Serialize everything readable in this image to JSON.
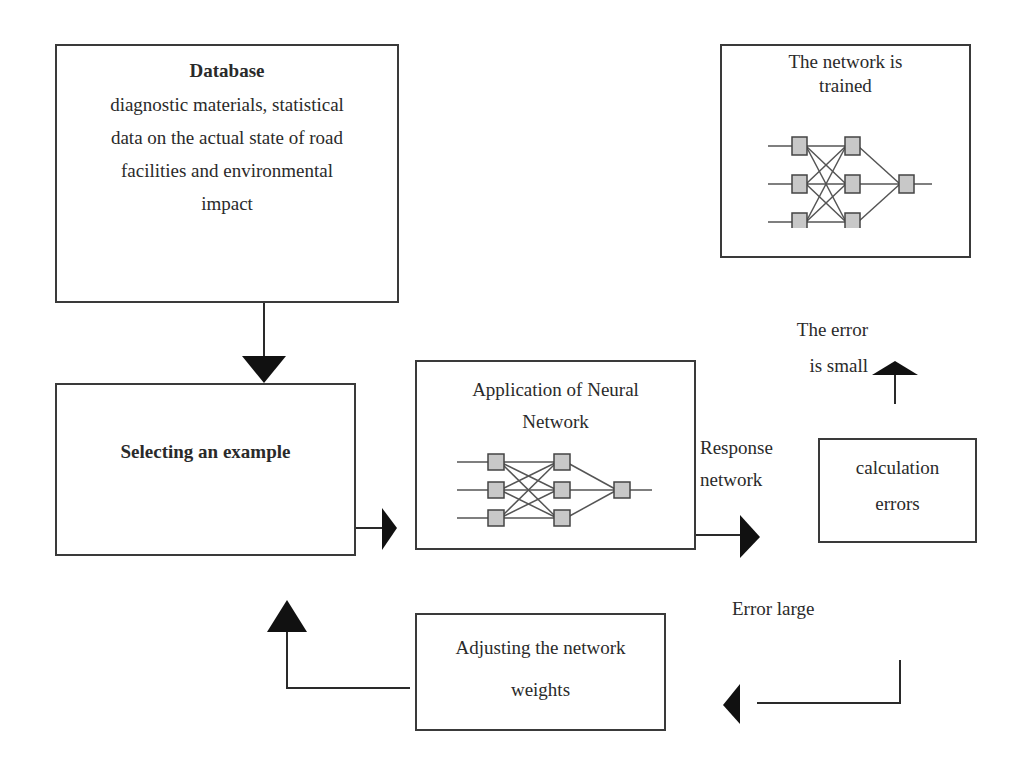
{
  "diagram": {
    "type": "flowchart",
    "colors": {
      "line": "#2a2a2a",
      "node_fill": "#c8c8c8",
      "node_stroke": "#444444",
      "background": "#ffffff"
    },
    "nodes": {
      "database": {
        "title": "Database",
        "lines": [
          "diagnostic materials, statistical",
          "data on the actual state of road",
          "facilities and environmental",
          "impact"
        ]
      },
      "selecting": {
        "title": "Selecting an example"
      },
      "application": {
        "lines": [
          "Application of Neural",
          "Network"
        ]
      },
      "calculation": {
        "lines": [
          "calculation",
          "errors"
        ]
      },
      "trained": {
        "lines": [
          "The network is",
          "trained"
        ]
      },
      "adjusting": {
        "lines": [
          "Adjusting the network",
          "weights"
        ]
      }
    },
    "labels": {
      "response": [
        "Response",
        "network"
      ],
      "error_small": [
        "The error",
        "is small"
      ],
      "error_large": "Error large"
    },
    "edges": [
      {
        "from": "database",
        "to": "selecting"
      },
      {
        "from": "selecting",
        "to": "application"
      },
      {
        "from": "application",
        "to": "calculation",
        "label": "Response network"
      },
      {
        "from": "calculation",
        "to": "trained",
        "label": "The error is small"
      },
      {
        "from": "calculation",
        "to": "adjusting",
        "label": "Error large"
      },
      {
        "from": "adjusting",
        "to": "selecting"
      }
    ],
    "neural_network_icon": {
      "layers": [
        3,
        3,
        1
      ]
    }
  }
}
